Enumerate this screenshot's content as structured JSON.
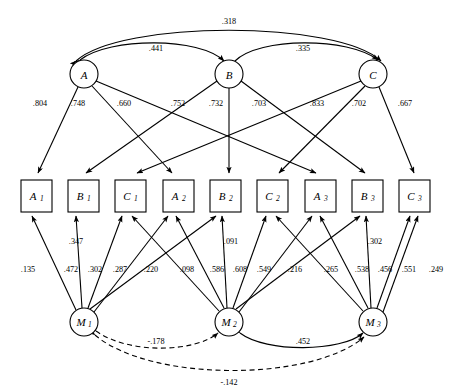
{
  "diagram": {
    "type": "sem-path-diagram",
    "trait_factors": [
      {
        "id": "A",
        "label": "A",
        "cx": 84,
        "cy": 74
      },
      {
        "id": "B",
        "label": "B",
        "cx": 229,
        "cy": 74
      },
      {
        "id": "C",
        "label": "C",
        "cx": 373,
        "cy": 74
      }
    ],
    "method_factors": [
      {
        "id": "M1",
        "label": "M",
        "sub": "1",
        "cx": 84,
        "cy": 322
      },
      {
        "id": "M2",
        "label": "M",
        "sub": "2",
        "cx": 229,
        "cy": 322
      },
      {
        "id": "M3",
        "label": "M",
        "sub": "3",
        "cx": 373,
        "cy": 322
      }
    ],
    "indicators": [
      {
        "id": "A1",
        "label": "A",
        "sub": "1",
        "x": 21,
        "y": 180
      },
      {
        "id": "B1",
        "label": "B",
        "sub": "1",
        "x": 68,
        "y": 180
      },
      {
        "id": "C1",
        "label": "C",
        "sub": "1",
        "x": 115,
        "y": 180
      },
      {
        "id": "A2",
        "label": "A",
        "sub": "2",
        "x": 163,
        "y": 180
      },
      {
        "id": "B2",
        "label": "B",
        "sub": "2",
        "x": 210,
        "y": 180
      },
      {
        "id": "C2",
        "label": "C",
        "sub": "2",
        "x": 257,
        "y": 180
      },
      {
        "id": "A3",
        "label": "A",
        "sub": "3",
        "x": 305,
        "y": 180
      },
      {
        "id": "B3",
        "label": "B",
        "sub": "3",
        "x": 352,
        "y": 180
      },
      {
        "id": "C3",
        "label": "C",
        "sub": "3",
        "x": 399,
        "y": 180
      }
    ],
    "trait_correlations": [
      {
        "from": "A",
        "to": "C",
        "value": ".318",
        "style": "solid",
        "label_x": 229,
        "label_y": 24
      },
      {
        "from": "A",
        "to": "B",
        "value": ".441",
        "style": "solid",
        "label_x": 156,
        "label_y": 51
      },
      {
        "from": "B",
        "to": "C",
        "value": ".335",
        "style": "solid",
        "label_x": 303,
        "label_y": 51
      }
    ],
    "method_correlations": [
      {
        "from": "M1",
        "to": "M2",
        "value": "-.178",
        "style": "dashed",
        "label_x": 156,
        "label_y": 344
      },
      {
        "from": "M2",
        "to": "M3",
        "value": ".452",
        "style": "solid",
        "label_x": 303,
        "label_y": 344
      },
      {
        "from": "M1",
        "to": "M3",
        "value": "-.142",
        "style": "dashed",
        "label_x": 229,
        "label_y": 385
      }
    ],
    "trait_loadings": [
      {
        "from": "A",
        "to": "A1",
        "value": ".804",
        "label_x": 40,
        "label_y": 106
      },
      {
        "from": "A",
        "to": "A2",
        "value": ".748",
        "label_x": 78,
        "label_y": 106
      },
      {
        "from": "A",
        "to": "A3",
        "value": ".660",
        "label_x": 124,
        "label_y": 106
      },
      {
        "from": "B",
        "to": "B1",
        "value": ".752",
        "label_x": 178,
        "label_y": 106
      },
      {
        "from": "B",
        "to": "B2",
        "value": ".732",
        "label_x": 216,
        "label_y": 106
      },
      {
        "from": "B",
        "to": "B3",
        "value": ".703",
        "label_x": 259,
        "label_y": 106
      },
      {
        "from": "C",
        "to": "C1",
        "value": ".833",
        "label_x": 317,
        "label_y": 106
      },
      {
        "from": "C",
        "to": "C2",
        "value": ".702",
        "label_x": 359,
        "label_y": 106
      },
      {
        "from": "C",
        "to": "C3",
        "value": ".667",
        "label_x": 405,
        "label_y": 106
      }
    ],
    "method_loadings": [
      {
        "from": "M1",
        "to": "A1",
        "value": ".135",
        "label_x": 28,
        "label_y": 272
      },
      {
        "from": "M1",
        "to": "B1",
        "value": ".472",
        "label_x": 71,
        "label_y": 272
      },
      {
        "from": "M1",
        "to": "C1",
        "value": ".302",
        "label_x": 95,
        "label_y": 272
      },
      {
        "from": "M1",
        "to": "A2",
        "value": ".287",
        "label_x": 120,
        "label_y": 272
      },
      {
        "from": "M1",
        "to": "B2",
        "value": ".347",
        "label_x": 76,
        "label_y": 244
      },
      {
        "from": "M2",
        "to": "C1",
        "value": ".220",
        "label_x": 151,
        "label_y": 272
      },
      {
        "from": "M2",
        "to": "A2",
        "value": ".098",
        "label_x": 187,
        "label_y": 272
      },
      {
        "from": "M2",
        "to": "B2",
        "value": ".586",
        "label_x": 217,
        "label_y": 272
      },
      {
        "from": "M2",
        "to": "C2",
        "value": ".608",
        "label_x": 240,
        "label_y": 272
      },
      {
        "from": "M2",
        "to": "A3",
        "value": ".549",
        "label_x": 264,
        "label_y": 272
      },
      {
        "from": "M2",
        "to": "B3",
        "value": ".091",
        "label_x": 231,
        "label_y": 244
      },
      {
        "from": "M3",
        "to": "C2",
        "value": ".216",
        "label_x": 295,
        "label_y": 272
      },
      {
        "from": "M3",
        "to": "A3",
        "value": ".265",
        "label_x": 331,
        "label_y": 272
      },
      {
        "from": "M3",
        "to": "B3",
        "value": ".538",
        "label_x": 362,
        "label_y": 272
      },
      {
        "from": "M3",
        "to": "C3",
        "value": ".456",
        "label_x": 385,
        "label_y": 272
      },
      {
        "from": "M3",
        "to": "C3b",
        "value": ".551",
        "label_x": 409,
        "label_y": 272
      },
      {
        "from": "M3",
        "to": "extra",
        "value": ".302",
        "label_x": 375,
        "label_y": 244
      },
      {
        "from": "M3",
        "to": "C3c",
        "value": ".249",
        "label_x": 436,
        "label_y": 272
      }
    ]
  }
}
